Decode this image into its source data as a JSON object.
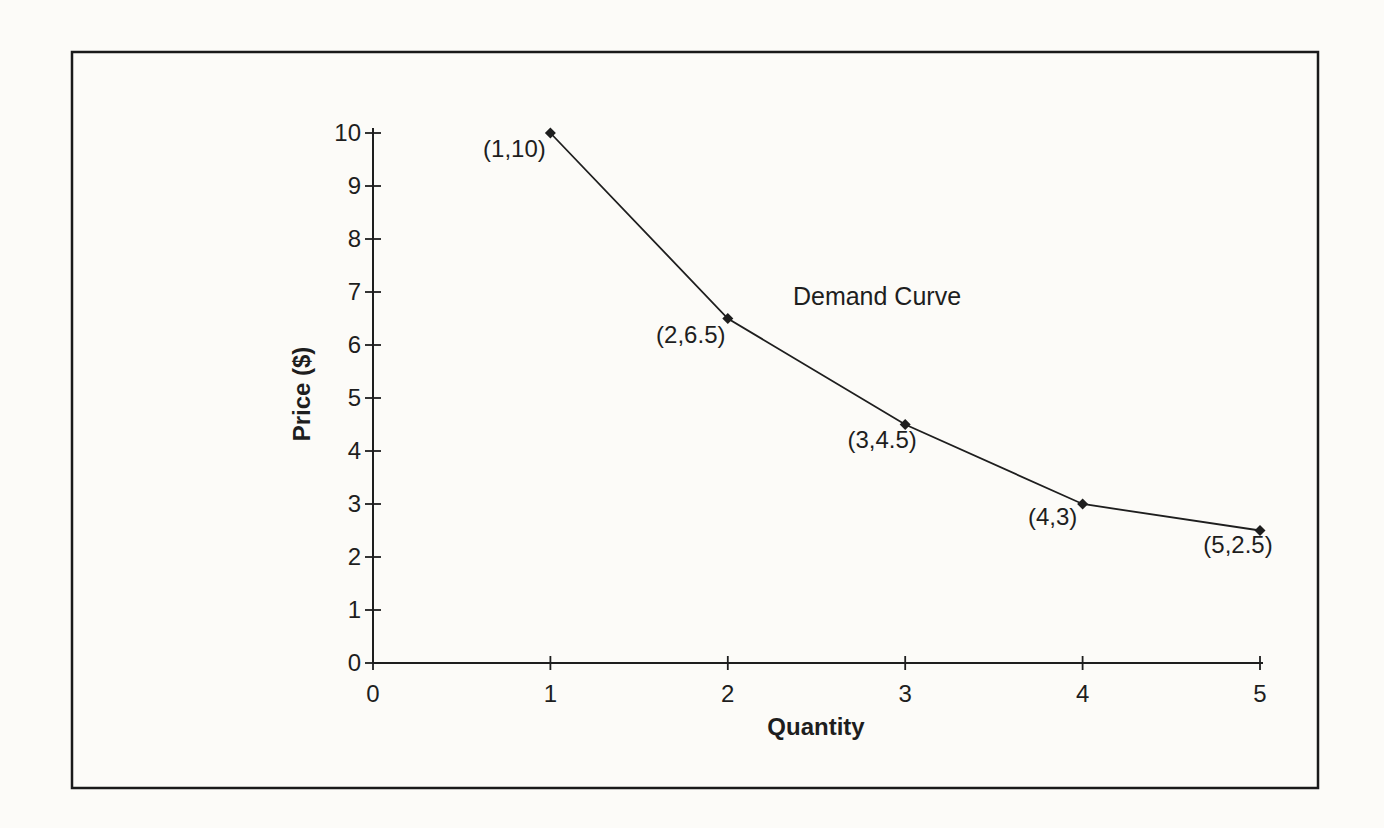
{
  "page": {
    "background": "#fcfbf8",
    "ink": "#1e1e1e",
    "frame_border": "#1a1a1a"
  },
  "chart_data": {
    "type": "line",
    "title": "",
    "xlabel": "Quantity",
    "ylabel": "Price ($)",
    "xlim": [
      0,
      5
    ],
    "ylim": [
      0,
      10
    ],
    "xticks": [
      "0",
      "1",
      "2",
      "3",
      "4",
      "5"
    ],
    "yticks": [
      "0",
      "1",
      "2",
      "3",
      "4",
      "5",
      "6",
      "7",
      "8",
      "9",
      "10"
    ],
    "grid": false,
    "legend_position": "none",
    "series": [
      {
        "name": "Demand Curve",
        "x": [
          1,
          2,
          3,
          4,
          5
        ],
        "y": [
          10,
          6.5,
          4.5,
          3,
          2.5
        ],
        "point_labels": [
          "(1,10)",
          "(2,6.5)",
          "(3,4.5)",
          "(4,3)",
          "(5,2.5)"
        ],
        "marker": "diamond",
        "color": "#1e1e1e"
      }
    ],
    "annotations": [
      {
        "text": "Demand Curve",
        "x": 2.84,
        "y": 6.75
      }
    ]
  }
}
